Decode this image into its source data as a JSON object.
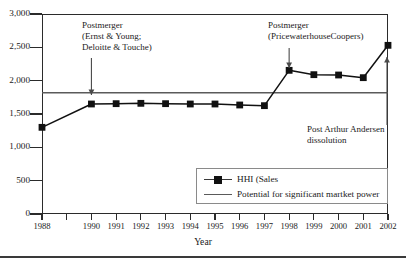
{
  "chart_data": {
    "type": "line",
    "title": "",
    "xlabel": "Year",
    "ylabel": "",
    "xlim": [
      1988,
      2002
    ],
    "ylim": [
      0,
      3000
    ],
    "grid": false,
    "legend_position": "bottom-right",
    "x": [
      1988,
      1989,
      1990,
      1991,
      1992,
      1993,
      1994,
      1995,
      1996,
      1997,
      1998,
      1999,
      2000,
      2001,
      2002
    ],
    "xtick_labels": [
      "1988",
      "",
      "1990",
      "1991",
      "1992",
      "1993",
      "1994",
      "1995",
      "1996",
      "1997",
      "1998",
      "1999",
      "2000",
      "2001",
      "2002"
    ],
    "ytick_labels": [
      "0",
      "500",
      "1,000",
      "1,500",
      "2,000",
      "2,500",
      "3,000"
    ],
    "ytick_values": [
      0,
      500,
      1000,
      1500,
      2000,
      2500,
      3000
    ],
    "series": [
      {
        "name": "HHI (Sales",
        "type": "line-marker",
        "marker": "square",
        "color": "#111111",
        "values": [
          1300,
          null,
          1650,
          1655,
          1660,
          1655,
          1650,
          1650,
          1635,
          1625,
          2155,
          2090,
          2085,
          2045,
          2530
        ]
      },
      {
        "name": "Potential for significant martket power",
        "type": "line",
        "marker": "none",
        "color": "#5a5a5a",
        "constant_value": 1820
      }
    ],
    "annotations": [
      {
        "id": "postmerger-ey-dt",
        "lines": [
          "Postmerger",
          "(Ernst & Young;",
          "Deloitte & Touche)"
        ],
        "arrow": "down",
        "points_at_year": 1990
      },
      {
        "id": "postmerger-pwc",
        "lines": [
          "Postmerger",
          "(PricewaterhouseCoopers)"
        ],
        "arrow": "down",
        "points_at_year": 1998
      },
      {
        "id": "post-arthur-andersen",
        "lines": [
          "Post Arthur Andersen",
          "dissolution"
        ],
        "arrow": "up",
        "points_at_year": 2002
      }
    ]
  },
  "legend": {
    "items": [
      {
        "label": "HHI (Sales",
        "key": "line-with-square-marker"
      },
      {
        "label": "Potential for significant martket power",
        "key": "plain-line"
      }
    ]
  },
  "axis": {
    "x_title": "Year"
  },
  "colors": {
    "series_primary": "#111111",
    "threshold_line": "#5a5a5a",
    "axis": "#2b2b2b",
    "text": "#1a1a1a",
    "background": "#ffffff"
  }
}
